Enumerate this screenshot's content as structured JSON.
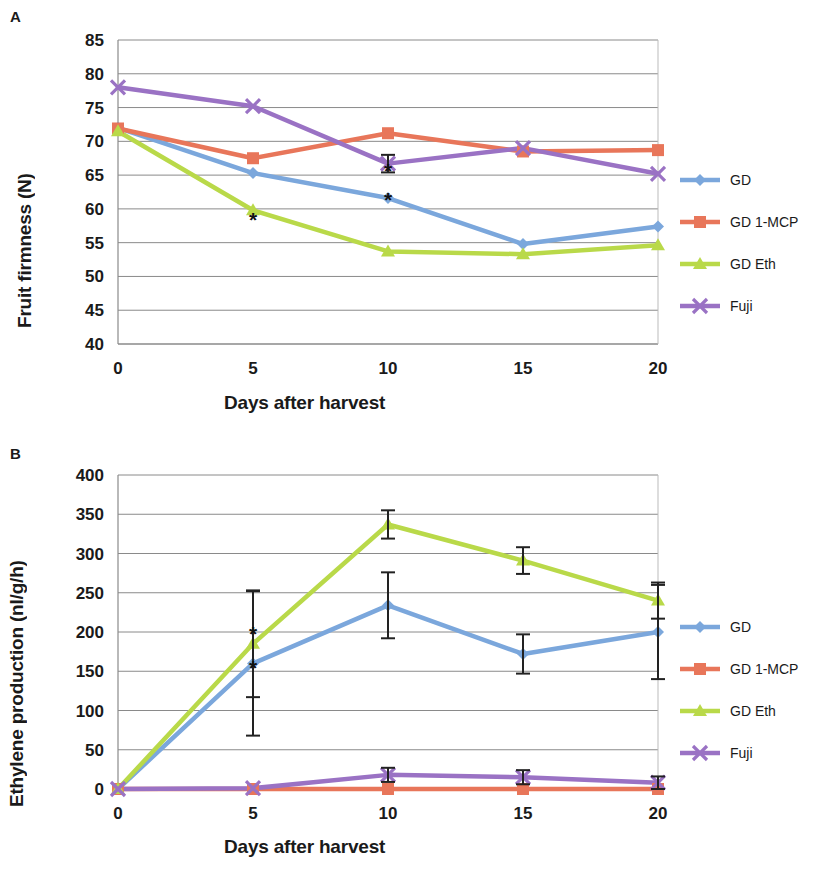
{
  "figure": {
    "panels": [
      {
        "letter": "A",
        "x_title": "Days after harvest",
        "y_title": "Fruit firmness (N)"
      },
      {
        "letter": "B",
        "x_title": "Days after harvest",
        "y_title": "Ethylene production (nl/g/h)"
      }
    ]
  },
  "colors": {
    "gd": "#7BA7DC",
    "gd_1mcp": "#E8765A",
    "gd_eth": "#B9D949",
    "fuji": "#9A72C4",
    "grid": "#8a8a8a",
    "text": "#1a1a1a",
    "error": "#222222"
  },
  "chart_data": [
    {
      "type": "line",
      "panel": "A",
      "title": "",
      "xlabel": "Days after harvest",
      "ylabel": "Fruit firmness (N)",
      "x": [
        0,
        5,
        10,
        15,
        20
      ],
      "xticklabels": [
        "0",
        "5",
        "10",
        "15",
        "20"
      ],
      "yticklabels": [
        "40",
        "45",
        "50",
        "55",
        "60",
        "65",
        "70",
        "75",
        "80",
        "85"
      ],
      "yticks": [
        40,
        45,
        50,
        55,
        60,
        65,
        70,
        75,
        80,
        85
      ],
      "ylim": [
        40,
        85
      ],
      "xlim": [
        0,
        20
      ],
      "grid": true,
      "legend_position": "right",
      "series": [
        {
          "name": "GD",
          "marker": "diamond",
          "color": "#7BA7DC",
          "values": [
            72.0,
            65.3,
            61.6,
            54.8,
            57.4
          ],
          "errors": [
            0,
            0,
            0,
            0,
            0
          ]
        },
        {
          "name": "GD 1-MCP",
          "marker": "square",
          "color": "#E8765A",
          "values": [
            71.9,
            67.5,
            71.2,
            68.5,
            68.7
          ],
          "errors": [
            0,
            0,
            0,
            0,
            0
          ]
        },
        {
          "name": "GD Eth",
          "marker": "triangle",
          "color": "#B9D949",
          "values": [
            71.5,
            59.8,
            53.7,
            53.3,
            54.6
          ],
          "errors": [
            0,
            0,
            0,
            0,
            0
          ]
        },
        {
          "name": "Fuji",
          "marker": "cross",
          "color": "#9A72C4",
          "values": [
            78.0,
            75.2,
            66.7,
            69.0,
            65.2
          ],
          "errors": [
            0,
            0,
            1.3,
            0,
            0
          ]
        }
      ],
      "annotations": [
        {
          "text": "*",
          "x": 5,
          "y": 57.3
        },
        {
          "text": "*",
          "x": 10,
          "y": 64.6
        },
        {
          "text": "*",
          "x": 10,
          "y": 60.3
        }
      ]
    },
    {
      "type": "line",
      "panel": "B",
      "title": "",
      "xlabel": "Days after harvest",
      "ylabel": "Ethylene production (nl/g/h)",
      "x": [
        0,
        5,
        10,
        15,
        20
      ],
      "xticklabels": [
        "0",
        "5",
        "10",
        "15",
        "20"
      ],
      "yticklabels": [
        "0",
        "50",
        "100",
        "150",
        "200",
        "250",
        "300",
        "350",
        "400"
      ],
      "yticks": [
        0,
        50,
        100,
        150,
        200,
        250,
        300,
        350,
        400
      ],
      "ylim": [
        0,
        400
      ],
      "xlim": [
        0,
        20
      ],
      "grid": true,
      "legend_position": "right",
      "series": [
        {
          "name": "GD",
          "marker": "diamond",
          "color": "#7BA7DC",
          "values": [
            0,
            160,
            234,
            172,
            200
          ],
          "errors": [
            0,
            92,
            42,
            25,
            60
          ]
        },
        {
          "name": "GD 1-MCP",
          "marker": "square",
          "color": "#E8765A",
          "values": [
            0,
            0,
            0,
            0,
            0
          ],
          "errors": [
            0,
            0,
            0,
            0,
            0
          ]
        },
        {
          "name": "GD Eth",
          "marker": "triangle",
          "color": "#B9D949",
          "values": [
            0,
            185,
            337,
            291,
            240
          ],
          "errors": [
            0,
            68,
            18,
            17,
            23
          ]
        },
        {
          "name": "Fuji",
          "marker": "cross",
          "color": "#9A72C4",
          "values": [
            0,
            1,
            18,
            15,
            8
          ],
          "errors": [
            0,
            0,
            9,
            9,
            8
          ]
        }
      ],
      "annotations": [
        {
          "text": "*",
          "x": 5,
          "y": 188
        },
        {
          "text": "*",
          "x": 5,
          "y": 145
        }
      ]
    }
  ]
}
